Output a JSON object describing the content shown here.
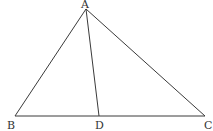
{
  "diagram": {
    "type": "geometry-triangle",
    "points": {
      "A": {
        "label": "A",
        "x": 86,
        "y": 9
      },
      "B": {
        "label": "B",
        "x": 15,
        "y": 116
      },
      "C": {
        "label": "C",
        "x": 205,
        "y": 116
      },
      "D": {
        "label": "D",
        "x": 99,
        "y": 116
      }
    },
    "segments": [
      "AB",
      "AC",
      "BC",
      "AD"
    ],
    "colors": {
      "line": "#3a3a3a",
      "text": "#333333",
      "background": "#ffffff"
    }
  }
}
